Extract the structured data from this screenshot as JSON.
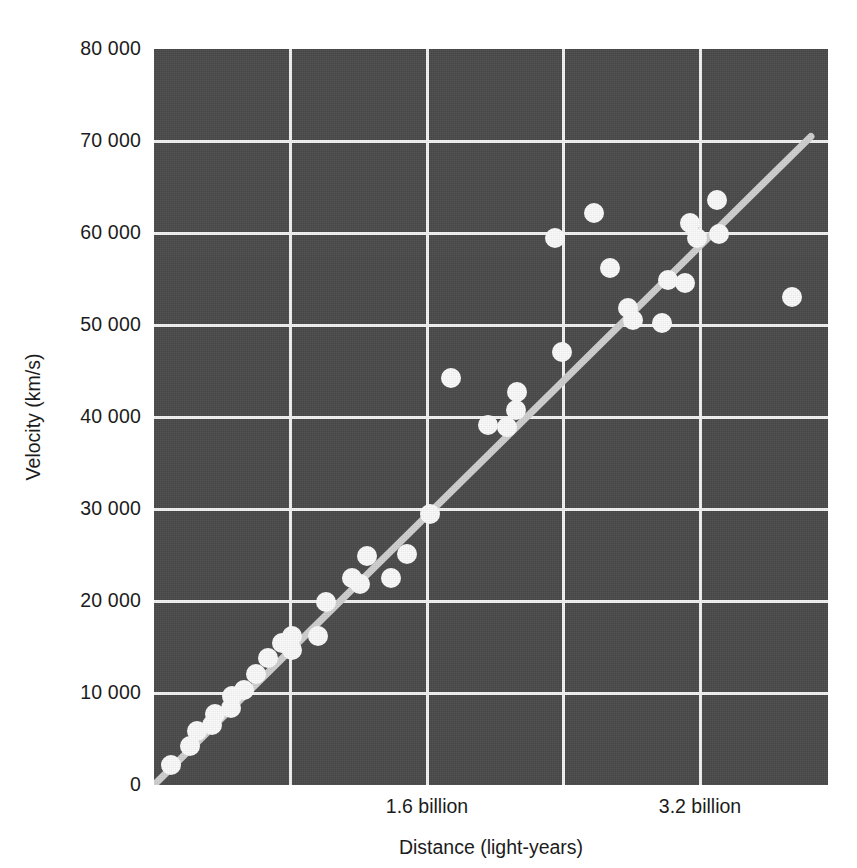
{
  "chart_data": {
    "type": "scatter",
    "title": "",
    "xlabel": "Distance (light-years)",
    "ylabel": "Velocity (km/s)",
    "xlim": [
      0,
      3.95
    ],
    "ylim": [
      0,
      80000
    ],
    "grid": true,
    "legend": null,
    "background_color": "#4a4a4a",
    "marker_color": "#fbfbfb",
    "gridline_color": "#f2f2f2",
    "trendline_color": "#cfcfcf",
    "x_tick_labels": [
      "1.6 billion",
      "3.2 billion"
    ],
    "x_tick_values": [
      1.6,
      3.2
    ],
    "x_gridline_values": [
      0.8,
      1.6,
      2.4,
      3.2
    ],
    "y_tick_labels": [
      "80 000",
      "70 000",
      "60 000",
      "50 000",
      "40 000",
      "30 000",
      "20 000",
      "10 000",
      "0"
    ],
    "y_tick_values": [
      80000,
      70000,
      60000,
      50000,
      40000,
      30000,
      20000,
      10000,
      0
    ],
    "trendline": {
      "x": [
        0.0,
        3.85
      ],
      "y": [
        0,
        70500
      ]
    },
    "x": [
      0.1,
      0.21,
      0.25,
      0.34,
      0.36,
      0.45,
      0.46,
      0.53,
      0.6,
      0.67,
      0.75,
      0.81,
      0.81,
      0.96,
      0.96,
      1.01,
      1.16,
      1.21,
      1.25,
      1.39,
      1.48,
      1.62,
      1.74,
      1.96,
      2.07,
      2.12,
      2.13,
      2.39,
      2.35,
      2.58,
      2.67,
      2.78,
      2.81,
      2.98,
      3.01,
      3.11,
      3.14,
      3.18,
      3.3,
      3.31,
      3.35,
      3.43,
      3.74
    ],
    "y": [
      2200,
      4200,
      5900,
      6500,
      7700,
      8400,
      9700,
      10300,
      12100,
      13800,
      15400,
      16200,
      14700,
      16200,
      16300,
      19900,
      22500,
      21900,
      24900,
      22500,
      25100,
      29500,
      44200,
      39100,
      38900,
      40800,
      42700,
      47100,
      59500,
      62200,
      56200,
      51900,
      50500,
      50200,
      54900,
      54600,
      61100,
      59500,
      63600,
      59900,
      53000,
      53000,
      53000
    ],
    "points": [
      {
        "x": 0.1,
        "y": 2200
      },
      {
        "x": 0.21,
        "y": 4200
      },
      {
        "x": 0.25,
        "y": 5900
      },
      {
        "x": 0.34,
        "y": 6500
      },
      {
        "x": 0.36,
        "y": 7700
      },
      {
        "x": 0.45,
        "y": 8400
      },
      {
        "x": 0.46,
        "y": 9700
      },
      {
        "x": 0.53,
        "y": 10300
      },
      {
        "x": 0.6,
        "y": 12100
      },
      {
        "x": 0.67,
        "y": 13800
      },
      {
        "x": 0.75,
        "y": 15400
      },
      {
        "x": 0.81,
        "y": 16200
      },
      {
        "x": 0.81,
        "y": 14700
      },
      {
        "x": 0.96,
        "y": 16200
      },
      {
        "x": 1.01,
        "y": 19900
      },
      {
        "x": 1.16,
        "y": 22500
      },
      {
        "x": 1.21,
        "y": 21900
      },
      {
        "x": 1.25,
        "y": 24900
      },
      {
        "x": 1.39,
        "y": 22500
      },
      {
        "x": 1.48,
        "y": 25100
      },
      {
        "x": 1.62,
        "y": 29500
      },
      {
        "x": 1.74,
        "y": 44200
      },
      {
        "x": 1.96,
        "y": 39100
      },
      {
        "x": 2.07,
        "y": 38900
      },
      {
        "x": 2.12,
        "y": 40800
      },
      {
        "x": 2.13,
        "y": 42700
      },
      {
        "x": 2.39,
        "y": 47100
      },
      {
        "x": 2.35,
        "y": 59500
      },
      {
        "x": 2.58,
        "y": 62200
      },
      {
        "x": 2.67,
        "y": 56200
      },
      {
        "x": 2.78,
        "y": 51900
      },
      {
        "x": 2.81,
        "y": 50500
      },
      {
        "x": 2.98,
        "y": 50200
      },
      {
        "x": 3.01,
        "y": 54900
      },
      {
        "x": 3.11,
        "y": 54600
      },
      {
        "x": 3.14,
        "y": 61100
      },
      {
        "x": 3.18,
        "y": 59500
      },
      {
        "x": 3.3,
        "y": 63600
      },
      {
        "x": 3.31,
        "y": 59900
      },
      {
        "x": 3.74,
        "y": 53000
      }
    ]
  }
}
